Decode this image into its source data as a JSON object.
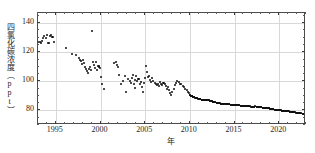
{
  "chart_data": {
    "type": "scatter",
    "title": "",
    "xlabel": "年",
    "ylabel": "四氯化碳浓度（ppt）",
    "xlim": [
      1993.0,
      2023.0
    ],
    "ylim": [
      70.0,
      147.0
    ],
    "grid": true,
    "legend": null,
    "marker_color": "#111111",
    "grid_color": "#d8d8d8",
    "frame_color": "#4a4a4a",
    "xticks": [
      1995,
      2000,
      2005,
      2010,
      2015,
      2020
    ],
    "xtick_labels": [
      "1995",
      "2000",
      "2005",
      "2010",
      "2015",
      "2020"
    ],
    "yticks": [
      80,
      100,
      120,
      140
    ],
    "ytick_labels": [
      "80",
      "100",
      "120",
      "140"
    ],
    "xminor_step": 1,
    "yminor_step": 5,
    "series": [
      {
        "name": "四氯化碳浓度",
        "x": [
          1993.05,
          1993.18,
          1993.3,
          1993.42,
          1993.55,
          1993.7,
          1993.85,
          1994.0,
          1994.12,
          1994.25,
          1994.38,
          1994.5,
          1994.62,
          1994.75,
          1996.15,
          1996.85,
          1997.25,
          1997.55,
          1997.72,
          1997.85,
          1997.95,
          1998.05,
          1998.18,
          1998.3,
          1998.42,
          1998.5,
          1998.6,
          1998.72,
          1998.82,
          1998.92,
          1999.02,
          1999.12,
          1999.25,
          1999.38,
          1999.48,
          1999.58,
          1999.7,
          1999.82,
          1999.92,
          2000.05,
          2000.2,
          2000.35,
          2001.55,
          2001.72,
          2001.85,
          2001.95,
          2002.1,
          2002.3,
          2002.5,
          2002.7,
          2002.9,
          2003.1,
          2003.25,
          2003.4,
          2003.52,
          2003.62,
          2003.72,
          2003.82,
          2003.9,
          2004.0,
          2004.12,
          2004.25,
          2004.38,
          2004.5,
          2004.62,
          2004.72,
          2004.85,
          2004.95,
          2005.05,
          2005.18,
          2005.3,
          2005.42,
          2005.55,
          2005.68,
          2005.8,
          2005.92,
          2006.05,
          2006.18,
          2006.3,
          2006.42,
          2006.55,
          2006.68,
          2006.8,
          2006.92,
          2007.05,
          2007.18,
          2007.3,
          2007.42,
          2007.55,
          2007.68,
          2007.8,
          2007.92,
          2008.05,
          2008.18,
          2008.3,
          2008.45,
          2008.6,
          2008.75,
          2008.9,
          2009.05,
          2009.2,
          2009.35,
          2009.5,
          2009.65,
          2009.8,
          2009.95
        ],
        "y": [
          126.8,
          127.2,
          126.4,
          127.8,
          129.5,
          131.0,
          129.8,
          131.6,
          126.5,
          126.2,
          131.0,
          132.0,
          130.5,
          127.0,
          122.8,
          118.8,
          118.0,
          116.2,
          115.0,
          113.8,
          112.0,
          114.5,
          112.5,
          110.0,
          108.5,
          107.0,
          106.0,
          108.5,
          110.0,
          107.5,
          134.8,
          113.0,
          111.0,
          109.5,
          113.0,
          108.0,
          110.5,
          110.2,
          109.0,
          103.0,
          98.5,
          94.5,
          112.5,
          113.0,
          111.5,
          110.0,
          104.5,
          98.5,
          100.0,
          104.0,
          93.0,
          101.5,
          100.5,
          99.0,
          102.0,
          104.5,
          98.0,
          101.0,
          95.5,
          103.5,
          100.5,
          101.5,
          98.5,
          99.5,
          96.0,
          93.0,
          99.0,
          102.0,
          110.5,
          106.5,
          103.0,
          104.0,
          101.0,
          99.5,
          102.0,
          100.5,
          99.0,
          98.0,
          97.5,
          98.0,
          97.0,
          99.5,
          98.5,
          97.8,
          99.0,
          98.0,
          96.5,
          95.0,
          96.0,
          94.0,
          92.0,
          90.5,
          93.0,
          95.0,
          97.5,
          99.0,
          100.0,
          99.5,
          98.5,
          98.0,
          97.0,
          96.0,
          95.0,
          94.0,
          93.0,
          92.0
        ]
      },
      {
        "name": "四氯化碳浓度（连续观测）",
        "x": [
          2010.0,
          2010.1,
          2010.2,
          2010.3,
          2010.4,
          2010.5,
          2010.6,
          2010.7,
          2010.8,
          2010.9,
          2011.0,
          2011.1,
          2011.2,
          2011.3,
          2011.4,
          2011.5,
          2011.6,
          2011.7,
          2011.8,
          2011.9,
          2012.0,
          2012.1,
          2012.2,
          2012.3,
          2012.4,
          2012.5,
          2012.6,
          2012.7,
          2012.8,
          2012.9,
          2013.0,
          2013.1,
          2013.2,
          2013.3,
          2013.4,
          2013.5,
          2013.6,
          2013.7,
          2013.8,
          2013.9,
          2014.0,
          2014.1,
          2014.2,
          2014.3,
          2014.4,
          2014.5,
          2014.6,
          2014.7,
          2014.8,
          2014.9,
          2015.0,
          2015.1,
          2015.2,
          2015.3,
          2015.4,
          2015.5,
          2015.6,
          2015.7,
          2015.8,
          2015.9,
          2016.0,
          2016.1,
          2016.2,
          2016.3,
          2016.4,
          2016.5,
          2016.6,
          2016.7,
          2016.8,
          2016.9,
          2017.0,
          2017.1,
          2017.2,
          2017.3,
          2017.4,
          2017.5,
          2017.6,
          2017.7,
          2017.8,
          2017.9,
          2018.0,
          2018.1,
          2018.2,
          2018.3,
          2018.4,
          2018.5,
          2018.6,
          2018.7,
          2018.8,
          2018.9,
          2019.0,
          2019.1,
          2019.2,
          2019.3,
          2019.4,
          2019.5,
          2019.6,
          2019.7,
          2019.8,
          2019.9,
          2020.0,
          2020.1,
          2020.2,
          2020.3,
          2020.4,
          2020.5,
          2020.6,
          2020.7,
          2020.8,
          2020.9,
          2021.0,
          2021.1,
          2021.2,
          2021.3,
          2021.4,
          2021.5,
          2021.6,
          2021.7,
          2021.8,
          2021.9,
          2022.0,
          2022.1,
          2022.2,
          2022.3,
          2022.4,
          2022.5,
          2022.6,
          2022.7,
          2022.8
        ],
        "y": [
          90.5,
          90.2,
          89.9,
          89.6,
          89.3,
          89.0,
          88.8,
          88.6,
          88.4,
          88.2,
          88.0,
          87.8,
          87.6,
          87.4,
          87.3,
          87.2,
          87.1,
          87.0,
          87.3,
          87.4,
          87.2,
          87.0,
          86.8,
          86.6,
          86.4,
          86.2,
          86.0,
          85.8,
          85.6,
          85.5,
          85.4,
          85.2,
          85.0,
          84.9,
          84.8,
          84.6,
          84.4,
          84.3,
          84.6,
          84.8,
          84.7,
          84.6,
          84.4,
          84.3,
          84.2,
          84.1,
          84.0,
          83.9,
          83.8,
          83.7,
          83.6,
          83.5,
          83.6,
          83.7,
          83.6,
          83.5,
          83.4,
          83.3,
          83.2,
          83.1,
          83.0,
          82.9,
          83.0,
          83.2,
          83.1,
          83.0,
          82.9,
          82.8,
          82.7,
          82.6,
          82.5,
          82.4,
          82.6,
          82.8,
          82.7,
          82.6,
          82.5,
          82.4,
          82.3,
          82.2,
          82.1,
          82.0,
          81.9,
          81.8,
          81.7,
          81.6,
          81.7,
          81.8,
          81.6,
          81.4,
          81.2,
          81.0,
          80.9,
          80.8,
          80.7,
          80.6,
          80.5,
          80.4,
          80.5,
          80.6,
          80.4,
          80.2,
          80.0,
          79.9,
          79.8,
          79.7,
          79.6,
          79.5,
          79.6,
          79.7,
          79.5,
          79.3,
          79.2,
          79.1,
          79.0,
          78.9,
          78.8,
          78.7,
          78.6,
          78.5,
          78.4,
          78.3,
          78.2,
          78.1,
          78.0,
          77.9,
          77.9,
          77.8,
          77.8
        ]
      }
    ]
  }
}
